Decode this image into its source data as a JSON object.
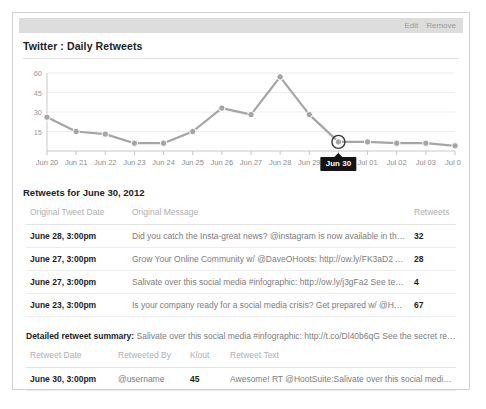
{
  "window": {
    "ghost_title": "",
    "edit_label": "Edit",
    "remove_label": "Remove"
  },
  "panel": {
    "title": "Twitter : Daily Retweets"
  },
  "chart_data": {
    "type": "line",
    "title": "Twitter : Daily Retweets",
    "xlabel": "",
    "ylabel": "",
    "grid": true,
    "legend": "none",
    "ylim": [
      0,
      60
    ],
    "yticks": [
      15,
      30,
      45,
      60
    ],
    "categories": [
      "Jun 20",
      "Jun 21",
      "Jun 22",
      "Jun 23",
      "Jun 24",
      "Jun 25",
      "Jun 26",
      "Jun 27",
      "Jun 28",
      "Jun 29",
      "Jun 30",
      "Jul 01",
      "Jul 02",
      "Jul 03",
      "Jul 04"
    ],
    "values": [
      26,
      15,
      13,
      6,
      6,
      15,
      33,
      28,
      57,
      28,
      7,
      7,
      6,
      6,
      4
    ],
    "series": [
      {
        "name": "Daily Retweets",
        "values": [
          26,
          15,
          13,
          6,
          6,
          15,
          33,
          28,
          57,
          28,
          7,
          7,
          6,
          6,
          4
        ],
        "color": "#a5a5a5"
      }
    ],
    "highlight": {
      "category": "Jun 30",
      "index": 10,
      "value": 7,
      "tooltip": "Jun 30"
    }
  },
  "retweets_section": {
    "heading": "Retweets for June 30, 2012",
    "columns": [
      "Original Tweet Date",
      "Original Message",
      "Retweets"
    ],
    "rows": [
      {
        "date": "June 28, 3:00pm",
        "message": "Did you catch the Insta-great news? @instagram is now available in the HootSuite...",
        "retweets": "32"
      },
      {
        "date": "June 27, 3:00pm",
        "message": "Grow Your Online Community w/ @DaveOHoots: http://ow.ly/FK3aD2 A sneak pea...",
        "retweets": "28"
      },
      {
        "date": "June 27, 3:00pm",
        "message": "Salivate over this social media #infographic: http://ow.ly/j3gFa2 See teh secret reci...",
        "retweets": "4"
      },
      {
        "date": "June 23, 3:00pm",
        "message": "Is your company ready for a social media crisis? Get prepared w/ @HootSuite_U...",
        "retweets": "67"
      }
    ]
  },
  "detail_section": {
    "summary_label": "Detailed retweet summary:",
    "summary_text": "Salivate over this social media #infographic: http://t.co/Dl40b6qG See the secret recipe for ...",
    "columns": [
      "Retweet Date",
      "Retweeted By",
      "Klout",
      "Retweet Text"
    ],
    "rows": [
      {
        "date": "June 30, 3:00pm",
        "by": "@username",
        "klout": "45",
        "text": "Awesome! RT @HootSuite:Salivate over this social media #infogr..."
      }
    ]
  }
}
